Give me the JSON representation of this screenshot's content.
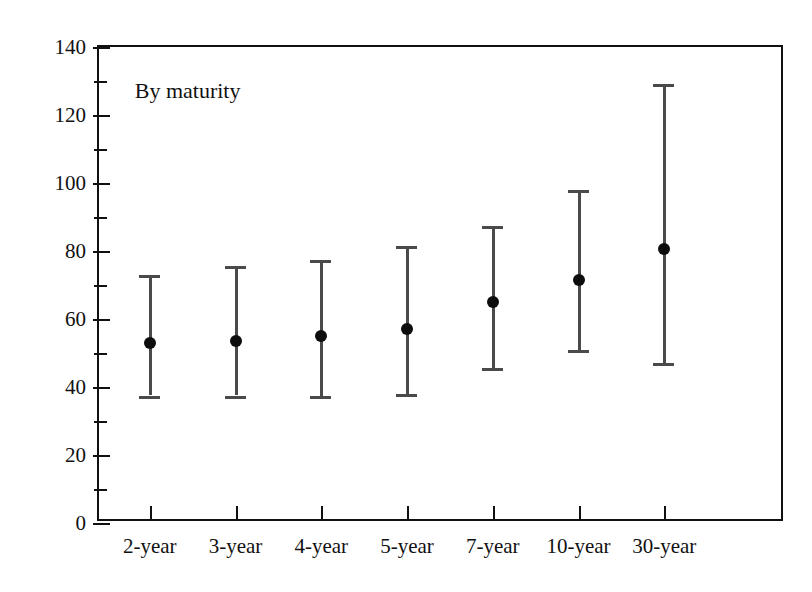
{
  "chart_data": {
    "type": "scatter",
    "title": "",
    "annotation": "By maturity",
    "xlabel": "",
    "ylabel": "",
    "categories": [
      "2-year",
      "3-year",
      "4-year",
      "5-year",
      "7-year",
      "10-year",
      "30-year"
    ],
    "ylim": [
      0,
      140
    ],
    "y_major_ticks": [
      0,
      20,
      40,
      60,
      80,
      100,
      120,
      140
    ],
    "y_minor_ticks": [
      10,
      30,
      50,
      70,
      90,
      110,
      130
    ],
    "y_tick_labels": [
      "0",
      "20",
      "40",
      "60",
      "80",
      "100",
      "120",
      "140"
    ],
    "grid": false,
    "legend": null,
    "series": [
      {
        "name": "midpoint",
        "marker": "filled-circle",
        "values": [
          53,
          53.5,
          55,
          57,
          65,
          71.5,
          80.5
        ]
      },
      {
        "name": "high",
        "marker": "cross-bar",
        "values": [
          73,
          75.5,
          77.5,
          81.5,
          87.5,
          98,
          129
        ]
      },
      {
        "name": "low",
        "marker": "cross-bar",
        "values": [
          37.5,
          37.5,
          37.5,
          38,
          45.5,
          51,
          47
        ]
      }
    ],
    "colors": {
      "axis": "#111111",
      "range_bar": "#4a4a4a",
      "midpoint_dot": "#0d0d0d",
      "background": "#ffffff"
    }
  }
}
